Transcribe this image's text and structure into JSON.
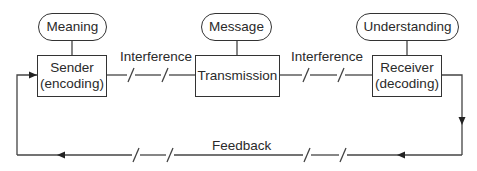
{
  "diagram": {
    "type": "communication-process-model",
    "stages": [
      {
        "id": "sender",
        "label_line1": "Sender",
        "label_line2": "(encoding)",
        "context": "Meaning"
      },
      {
        "id": "transmission",
        "label": "Transmission",
        "context": "Message"
      },
      {
        "id": "receiver",
        "label_line1": "Receiver",
        "label_line2": "(decoding)",
        "context": "Understanding"
      }
    ],
    "interference": [
      "Interference",
      "Interference"
    ],
    "feedback_label": "Feedback",
    "colors": {
      "stroke": "#333333",
      "text": "#2a2a2a",
      "background": "#ffffff"
    }
  }
}
